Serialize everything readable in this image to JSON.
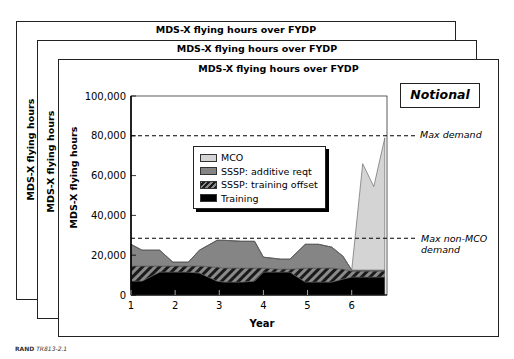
{
  "frames": [
    {
      "title": "MDS-X flying hours over FYDP",
      "ylabel": "MDS-X flying hours"
    },
    {
      "title": "MDS-X flying hours over FYDP",
      "ylabel": "MDS-X flying hours"
    },
    {
      "title": "MDS-X flying hours over FYDP",
      "ylabel": "MDS-X flying hours"
    }
  ],
  "badge": "Notional",
  "annotations": {
    "max_demand": "Max demand",
    "max_non_mco_line1": "Max non-MCO",
    "max_non_mco_line2": "demand"
  },
  "legend": [
    {
      "label": "MCO",
      "color": "#d4d4d4"
    },
    {
      "label": "SSSP: additive reqt",
      "color": "#858585"
    },
    {
      "label": "SSSP: training offset",
      "color": "hatch"
    },
    {
      "label": "Training",
      "color": "#000000"
    }
  ],
  "footer": {
    "org": "RAND",
    "id": "TR813-2.1"
  },
  "chart_data": {
    "type": "area",
    "title": "MDS-X flying hours over FYDP",
    "xlabel": "Year",
    "ylabel": "MDS-X flying hours",
    "xlim": [
      1,
      6.8
    ],
    "ylim": [
      0,
      100000
    ],
    "xticks": [
      1,
      2,
      3,
      4,
      5,
      6
    ],
    "yticks": [
      0,
      20000,
      40000,
      60000,
      80000,
      100000
    ],
    "ytick_labels": [
      "0",
      "20,000",
      "40,000",
      "60,000",
      "80,000",
      "100,000"
    ],
    "grid": false,
    "stacked": true,
    "x": [
      1.0,
      1.25,
      1.65,
      1.95,
      2.3,
      2.55,
      2.95,
      3.1,
      3.5,
      3.8,
      4.0,
      4.4,
      4.6,
      4.95,
      5.25,
      5.55,
      5.8,
      6.0,
      6.25,
      6.5,
      6.75
    ],
    "series": [
      {
        "name": "Training",
        "values": [
          7000,
          7000,
          11500,
          11500,
          11500,
          11000,
          7000,
          6500,
          6500,
          7000,
          11500,
          11500,
          11500,
          6500,
          6500,
          6500,
          8000,
          9000,
          9000,
          9000,
          9000
        ]
      },
      {
        "name": "SSSP: training offset",
        "values": [
          7500,
          7500,
          3000,
          3000,
          3000,
          3500,
          7000,
          7000,
          7000,
          6500,
          2000,
          1500,
          1500,
          7000,
          7000,
          7000,
          5000,
          3000,
          3000,
          3000,
          3000
        ]
      },
      {
        "name": "SSSP: additive reqt",
        "values": [
          11000,
          8000,
          8000,
          2000,
          2000,
          8000,
          13500,
          14000,
          13500,
          13500,
          5500,
          5000,
          5000,
          12000,
          12000,
          10500,
          6500,
          500,
          500,
          500,
          500
        ]
      },
      {
        "name": "MCO",
        "values": [
          0,
          0,
          0,
          0,
          0,
          0,
          0,
          0,
          0,
          0,
          0,
          0,
          0,
          0,
          0,
          0,
          0,
          0,
          53500,
          42000,
          66500
        ]
      }
    ],
    "reference_lines": [
      {
        "label": "Max demand",
        "y": 80000,
        "style": "dashed"
      },
      {
        "label": "Max non-MCO demand",
        "y": 28500,
        "style": "dashed"
      }
    ],
    "legend_position": "upper-left-inside",
    "annotations": [
      "Notional"
    ]
  }
}
